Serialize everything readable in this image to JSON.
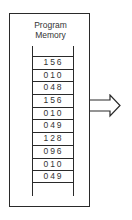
{
  "diagram": {
    "title_line1": "Program",
    "title_line2": "Memory",
    "memory_values": [
      "156",
      "010",
      "048",
      "156",
      "010",
      "049",
      "128",
      "096",
      "010",
      "049"
    ],
    "output_arrow": "right-arrow-icon"
  }
}
